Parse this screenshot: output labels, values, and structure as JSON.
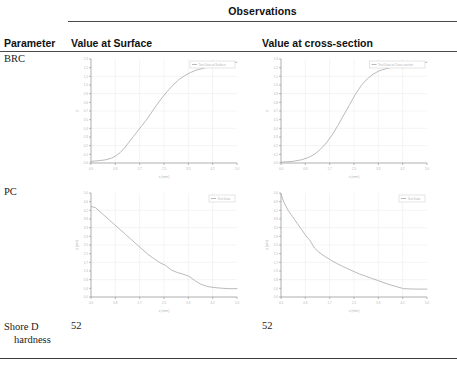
{
  "table": {
    "group_header": "Observations",
    "columns": {
      "parameter": "Parameter",
      "value_at_surface": "Value at Surface",
      "value_at_cross_section": "Value at cross-section"
    },
    "rows": [
      {
        "parameter": "BRC",
        "type": "chart"
      },
      {
        "parameter": "PC",
        "type": "chart"
      },
      {
        "parameter_line1": "Shore D",
        "parameter_line2": "hardness",
        "type": "scalar",
        "value_at_surface": "52",
        "value_at_cross_section": "52"
      }
    ]
  },
  "colors": {
    "rule": "#4a4a4a",
    "axis": "#8c8c8c",
    "grid": "#e8e8e8",
    "curve": "#a8a8a8",
    "legend_border": "#c9c9c9",
    "tick_label": "#b4b4b4",
    "text": "#1a1a1a"
  },
  "chart_data": [
    {
      "id": "brc-surface",
      "type": "line",
      "title": "",
      "xlabel": "x (mm)",
      "ylabel": "y",
      "legend": [
        "Test Data at Surface"
      ],
      "legend_position": "top-right",
      "grid": true,
      "xlim": [
        0.0,
        5.0
      ],
      "ylim": [
        0.0,
        1.3
      ],
      "x": [
        0.0,
        0.3,
        0.5,
        0.7,
        0.85,
        1.0,
        1.15,
        1.3,
        1.45,
        1.6,
        1.75,
        1.9,
        2.05,
        2.2,
        2.4,
        2.6,
        2.8,
        3.0,
        3.2,
        3.4,
        3.6,
        3.8,
        4.0,
        4.25,
        4.5,
        4.75,
        5.0
      ],
      "y": [
        0.02,
        0.03,
        0.04,
        0.06,
        0.09,
        0.13,
        0.19,
        0.26,
        0.33,
        0.4,
        0.47,
        0.54,
        0.62,
        0.7,
        0.8,
        0.89,
        0.97,
        1.04,
        1.09,
        1.13,
        1.16,
        1.18,
        1.2,
        1.22,
        1.24,
        1.25,
        1.26
      ]
    },
    {
      "id": "brc-cross-section",
      "type": "line",
      "title": "",
      "xlabel": "x (mm)",
      "ylabel": "y",
      "legend": [
        "Test Data at Cross-section"
      ],
      "legend_position": "top-right",
      "grid": true,
      "xlim": [
        0.0,
        5.0
      ],
      "ylim": [
        0.0,
        1.3
      ],
      "x": [
        0.0,
        0.4,
        0.7,
        0.95,
        1.15,
        1.35,
        1.55,
        1.75,
        1.95,
        2.15,
        2.35,
        2.55,
        2.75,
        2.95,
        3.15,
        3.35,
        3.6,
        3.85,
        4.1,
        4.4,
        4.7,
        5.0
      ],
      "y": [
        0.01,
        0.02,
        0.04,
        0.07,
        0.11,
        0.17,
        0.25,
        0.35,
        0.47,
        0.6,
        0.73,
        0.86,
        0.97,
        1.05,
        1.11,
        1.15,
        1.18,
        1.2,
        1.22,
        1.24,
        1.25,
        1.26
      ]
    },
    {
      "id": "pc-surface",
      "type": "line",
      "title": "",
      "xlabel": "x (mm)",
      "ylabel": "y (µm)",
      "legend": [
        "Test Data"
      ],
      "legend_position": "top-right",
      "grid": true,
      "xlim": [
        0.0,
        5.0
      ],
      "ylim": [
        0.0,
        5.0
      ],
      "x": [
        0.0,
        0.15,
        0.35,
        0.55,
        0.75,
        0.95,
        1.15,
        1.35,
        1.55,
        1.75,
        1.95,
        2.1,
        2.25,
        2.4,
        2.55,
        2.75,
        2.95,
        3.15,
        3.35,
        3.55,
        3.75,
        4.0,
        4.25,
        4.5,
        4.75,
        5.0
      ],
      "y": [
        4.35,
        4.3,
        4.05,
        3.8,
        3.55,
        3.3,
        3.05,
        2.8,
        2.55,
        2.3,
        2.05,
        1.9,
        1.75,
        1.62,
        1.52,
        1.3,
        1.18,
        1.1,
        1.0,
        0.8,
        0.62,
        0.5,
        0.45,
        0.42,
        0.4,
        0.4
      ]
    },
    {
      "id": "pc-cross-section",
      "type": "line",
      "title": "",
      "xlabel": "x (mm)",
      "ylabel": "y (µm)",
      "legend": [
        "Test Data"
      ],
      "legend_position": "top-right",
      "grid": true,
      "xlim": [
        0.0,
        5.0
      ],
      "ylim": [
        0.0,
        5.0
      ],
      "x": [
        0.0,
        0.1,
        0.25,
        0.4,
        0.55,
        0.7,
        0.85,
        1.0,
        1.15,
        1.3,
        1.5,
        1.7,
        1.9,
        2.1,
        2.3,
        2.5,
        2.7,
        2.9,
        3.1,
        3.3,
        3.5,
        3.7,
        3.9,
        4.2,
        4.6,
        5.0
      ],
      "y": [
        4.95,
        4.55,
        4.15,
        3.85,
        3.55,
        3.25,
        2.95,
        2.7,
        2.35,
        2.15,
        1.95,
        1.78,
        1.62,
        1.48,
        1.35,
        1.22,
        1.1,
        1.0,
        0.9,
        0.8,
        0.7,
        0.6,
        0.52,
        0.4,
        0.38,
        0.38
      ]
    }
  ]
}
